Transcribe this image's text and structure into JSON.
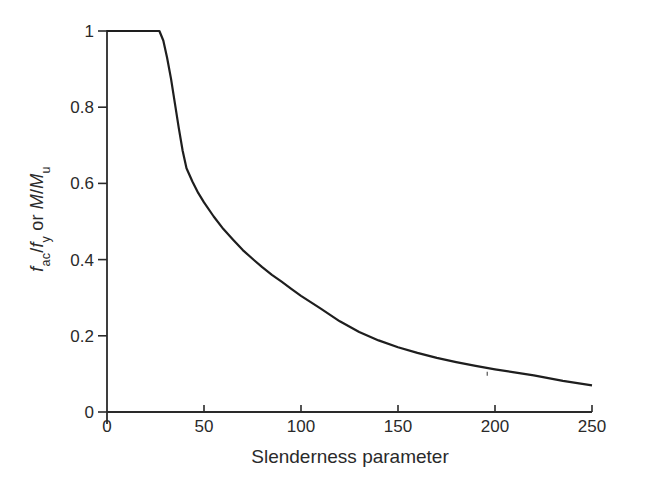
{
  "figure": {
    "background_color": "#ffffff",
    "line_color": "#1e1e1e",
    "axis_color": "#2a2a2a",
    "text_color": "#2a2a2a"
  },
  "chart_data": {
    "type": "line",
    "title": "",
    "xlabel": "Slenderness parameter",
    "ylabel": "fac/fy or M/Mu",
    "ylabel_parts": {
      "f1": "f",
      "sub1": "ac",
      "slash1": "/",
      "f2": "f",
      "sub2": "y",
      "mid": " or ",
      "m1": "M",
      "slash2": "/",
      "m2": "M",
      "sub3": "u"
    },
    "xlim": [
      0,
      250
    ],
    "ylim": [
      0,
      1
    ],
    "xticks": [
      0,
      50,
      100,
      150,
      200,
      250
    ],
    "xtick_labels": [
      "0",
      "50",
      "100",
      "150",
      "200",
      "250"
    ],
    "yticks": [
      0,
      0.2,
      0.4,
      0.6,
      0.8,
      1
    ],
    "ytick_labels": [
      "0",
      "0.2",
      "0.4",
      "0.6",
      "0.8",
      "1"
    ],
    "grid": false,
    "legend": null,
    "series": [
      {
        "name": "curve",
        "x": [
          0,
          27,
          29,
          31,
          33,
          35,
          37,
          39,
          41,
          44,
          47,
          50,
          55,
          60,
          65,
          70,
          75,
          80,
          85,
          90,
          95,
          100,
          110,
          120,
          130,
          140,
          150,
          160,
          170,
          180,
          190,
          200,
          210,
          220,
          235,
          250
        ],
        "y": [
          1.0,
          1.0,
          0.975,
          0.93,
          0.875,
          0.81,
          0.745,
          0.685,
          0.64,
          0.605,
          0.575,
          0.55,
          0.513,
          0.48,
          0.452,
          0.425,
          0.402,
          0.38,
          0.36,
          0.342,
          0.323,
          0.305,
          0.272,
          0.238,
          0.21,
          0.188,
          0.17,
          0.155,
          0.142,
          0.131,
          0.121,
          0.112,
          0.104,
          0.096,
          0.082,
          0.07
        ]
      }
    ],
    "stray_marks": [
      {
        "x": 196,
        "y": 0.108
      }
    ]
  }
}
